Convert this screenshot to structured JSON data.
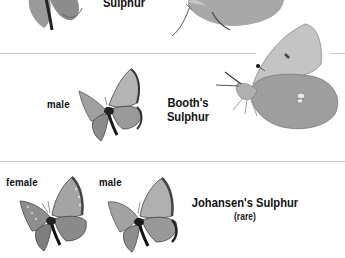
{
  "page": {
    "background": "#ffffff",
    "sections": [
      {
        "id": "section-top-partial",
        "species_name_lines": [
          "Sulphur"
        ],
        "specimens": [
          {
            "label": "",
            "view": "dorsal-partial"
          },
          {
            "label": "",
            "view": "ventral-partial"
          }
        ]
      },
      {
        "id": "section-booths-sulphur",
        "species_name_lines": [
          "Booth's",
          "Sulphur"
        ],
        "specimens": [
          {
            "label": "male",
            "view": "dorsal"
          },
          {
            "label": "",
            "view": "ventral"
          }
        ]
      },
      {
        "id": "section-johansens-sulphur",
        "species_name": "Johansen's Sulphur",
        "note": "(rare)",
        "specimens": [
          {
            "label": "female",
            "view": "dorsal"
          },
          {
            "label": "male",
            "view": "dorsal"
          }
        ]
      }
    ]
  }
}
